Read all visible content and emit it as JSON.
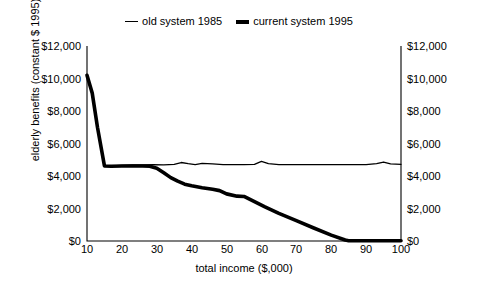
{
  "chart_data": {
    "type": "line",
    "title": "",
    "xlabel": "total income ($,000)",
    "ylabel": "elderly benefits (constant $ 1995)",
    "xlim": [
      10,
      100
    ],
    "ylim": [
      0,
      12000
    ],
    "xticks": [
      "10",
      "20",
      "30",
      "40",
      "50",
      "60",
      "70",
      "80",
      "90",
      "100"
    ],
    "xtick_values": [
      10,
      20,
      30,
      40,
      50,
      60,
      70,
      80,
      90,
      100
    ],
    "yticks": [
      "$0",
      "$2,000",
      "$4,000",
      "$6,000",
      "$8,000",
      "$10,000",
      "$12,000"
    ],
    "ytick_values": [
      0,
      2000,
      4000,
      6000,
      8000,
      10000,
      12000
    ],
    "grid": false,
    "legend_position": "top-center",
    "axes": {
      "left_labels": [
        "$12,000",
        "$10,000",
        "$8,000",
        "$6,000",
        "$4,000",
        "$2,000",
        "$0"
      ],
      "right_labels": [
        "$12,000",
        "$10,000",
        "$8,000",
        "$6,000",
        "$4,000",
        "$2,000",
        "$0"
      ]
    },
    "series": [
      {
        "name": "old system 1985",
        "style": "thin",
        "x": [
          10,
          11.5,
          13,
          15,
          17,
          20,
          23,
          26,
          29,
          32,
          35,
          37,
          39,
          41,
          43,
          46,
          49,
          52,
          55,
          58,
          60,
          62,
          65,
          70,
          75,
          80,
          85,
          90,
          93,
          95,
          97,
          100
        ],
        "values": [
          10200,
          9100,
          7000,
          4620,
          4620,
          4660,
          4680,
          4690,
          4700,
          4680,
          4720,
          4830,
          4760,
          4700,
          4780,
          4740,
          4700,
          4700,
          4700,
          4720,
          4900,
          4760,
          4700,
          4700,
          4700,
          4700,
          4700,
          4700,
          4760,
          4860,
          4740,
          4720
        ]
      },
      {
        "name": "current system 1995",
        "style": "thick",
        "x": [
          10,
          11.5,
          13,
          15,
          17,
          20,
          23,
          26,
          28,
          30,
          32,
          34,
          36,
          38,
          40,
          43,
          46,
          48,
          50,
          53,
          55,
          58,
          61,
          65,
          70,
          75,
          80,
          84,
          85,
          90,
          95,
          100
        ],
        "values": [
          10200,
          9100,
          7000,
          4620,
          4600,
          4620,
          4620,
          4620,
          4600,
          4480,
          4200,
          3900,
          3680,
          3500,
          3400,
          3280,
          3180,
          3100,
          2900,
          2760,
          2740,
          2420,
          2100,
          1700,
          1250,
          800,
          360,
          60,
          20,
          20,
          20,
          20
        ]
      }
    ]
  }
}
